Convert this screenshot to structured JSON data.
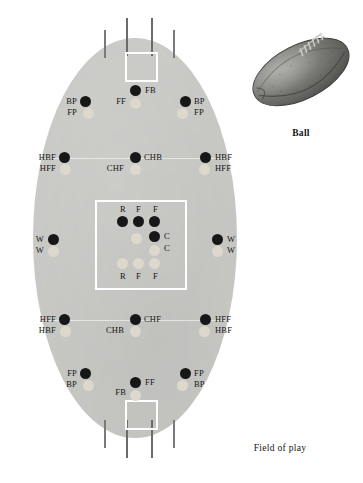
{
  "figure": {
    "field_caption": "Field of play",
    "ball_caption": "Ball"
  },
  "field": {
    "colors": {
      "ground": "#c9c9c6",
      "line": "#ffffff",
      "team_a_dot": "#171717",
      "team_b_dot": "#dcd8cc",
      "post": "#6b6b6b",
      "page": "#ffffff"
    }
  },
  "positions": {
    "top_forward_line": [
      {
        "id": "bp-left",
        "labels": [
          "BP",
          "FP"
        ],
        "side": "left"
      },
      {
        "id": "fb-center",
        "labels": [
          "FB",
          "FF"
        ],
        "side": "center"
      },
      {
        "id": "bp-right",
        "labels": [
          "BP",
          "FP"
        ],
        "side": "right"
      }
    ],
    "top_half_line": [
      {
        "id": "hbf-left",
        "labels": [
          "HBF",
          "HFF"
        ],
        "side": "left"
      },
      {
        "id": "chb-center",
        "labels": [
          "CHB",
          "CHF"
        ],
        "side": "center"
      },
      {
        "id": "hbf-right",
        "labels": [
          "HBF",
          "HFF"
        ],
        "side": "right"
      }
    ],
    "wings": [
      {
        "id": "w-left",
        "labels": [
          "W",
          "W"
        ],
        "side": "left"
      },
      {
        "id": "w-right",
        "labels": [
          "W",
          "W"
        ],
        "side": "right"
      }
    ],
    "center_square": {
      "top_labels": [
        "R",
        "F",
        "F"
      ],
      "bottom_labels": [
        "R",
        "F",
        "F"
      ],
      "center_labels": [
        "C",
        "C"
      ]
    },
    "bottom_half_line": [
      {
        "id": "hff-left",
        "labels": [
          "HFF",
          "HBF"
        ],
        "side": "left"
      },
      {
        "id": "chf-center",
        "labels": [
          "CHF",
          "CHB"
        ],
        "side": "center"
      },
      {
        "id": "hff-right",
        "labels": [
          "HFF",
          "HBF"
        ],
        "side": "right"
      }
    ],
    "bottom_forward_line": [
      {
        "id": "fp-left",
        "labels": [
          "FP",
          "BP"
        ],
        "side": "left"
      },
      {
        "id": "ff-center",
        "labels": [
          "FF",
          "FB"
        ],
        "side": "center"
      },
      {
        "id": "fp-right",
        "labels": [
          "FP",
          "BP"
        ],
        "side": "right"
      }
    ]
  },
  "labels": {
    "t_bp_l": "BP",
    "t_fp_l": "FP",
    "t_ff_c": "FF",
    "t_fb_c": "FB",
    "t_bp_r": "BP",
    "t_fp_r": "FP",
    "t_hbf_l": "HBF",
    "t_hff_l": "HFF",
    "t_chf_c": "CHF",
    "t_chb_c": "CHB",
    "t_hbf_r": "HBF",
    "t_hff_r": "HFF",
    "w_l_1": "W",
    "w_l_2": "W",
    "w_r_1": "W",
    "w_r_2": "W",
    "cs_r_top": "R",
    "cs_f1_top": "F",
    "cs_f2_top": "F",
    "cs_c1": "C",
    "cs_c2": "C",
    "cs_r_bot": "R",
    "cs_f1_bot": "F",
    "cs_f2_bot": "F",
    "b_hff_l": "HFF",
    "b_hbf_l": "HBF",
    "b_chb_c": "CHB",
    "b_chf_c": "CHF",
    "b_hff_r": "HFF",
    "b_hbf_r": "HBF",
    "b_fp_l": "FP",
    "b_bp_l": "BP",
    "b_fb_c": "FB",
    "b_ff_c": "FF",
    "b_fp_r": "FP",
    "b_bp_r": "BP"
  }
}
